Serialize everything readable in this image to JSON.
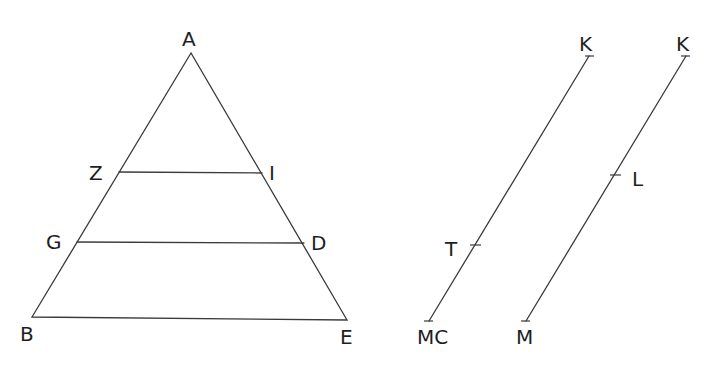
{
  "diagram": {
    "background": "#ffffff",
    "line_color": "#3a3a3a",
    "triangle": {
      "vertices": {
        "A": {
          "label": "A",
          "x": 191,
          "y": 53
        },
        "B": {
          "label": "B",
          "x": 32,
          "y": 317
        },
        "E": {
          "label": "E",
          "x": 347,
          "y": 320
        }
      },
      "transversals": [
        {
          "name": "ZI",
          "left": {
            "label": "Z",
            "x": 119,
            "y": 172
          },
          "right": {
            "label": "I",
            "x": 262,
            "y": 173
          }
        },
        {
          "name": "GD",
          "left": {
            "label": "G",
            "x": 77,
            "y": 242
          },
          "right": {
            "label": "D",
            "x": 304,
            "y": 243
          }
        }
      ]
    },
    "segments": [
      {
        "name": "K-MC",
        "top": {
          "label": "K",
          "x": 589,
          "y": 56
        },
        "bottom": {
          "label": "MC",
          "x": 429,
          "y": 321
        },
        "mark": {
          "label": "T",
          "x": 473,
          "y": 245
        }
      },
      {
        "name": "K-M",
        "top": {
          "label": "K",
          "x": 686,
          "y": 56
        },
        "bottom": {
          "label": "M",
          "x": 526,
          "y": 321
        },
        "mark": {
          "label": "L",
          "x": 616,
          "y": 175
        }
      }
    ]
  }
}
